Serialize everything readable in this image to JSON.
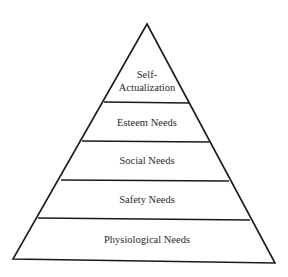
{
  "diagram": {
    "title": "",
    "type": "pyramid",
    "levels": [
      {
        "label_lines": [
          "Self-",
          "Actualization"
        ]
      },
      {
        "label_lines": [
          "Esteem Needs"
        ]
      },
      {
        "label_lines": [
          "Social Needs"
        ]
      },
      {
        "label_lines": [
          "Safety Needs"
        ]
      },
      {
        "label_lines": [
          "Physiological Needs"
        ]
      }
    ]
  }
}
